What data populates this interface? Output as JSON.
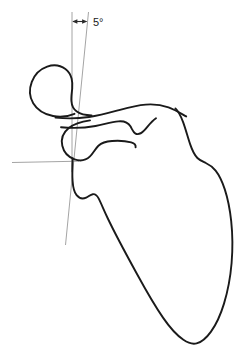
{
  "figure": {
    "kind": "anatomical-line-drawing",
    "width": 251,
    "height": 362,
    "background_color": "#ffffff"
  },
  "annotation": {
    "angle_label": "5°",
    "angle_value": 5,
    "angle_unit": "degrees",
    "arrow_style": "double-headed",
    "label_position": "top-right-of-arrow"
  },
  "colors": {
    "outline": "#1a1a1a",
    "reference_line": "#9a9a9a",
    "arrow": "#2b2b2b",
    "text": "#1a1a1a",
    "background": "#ffffff"
  },
  "reference_lines": {
    "vertical_label": "vertical reference axis",
    "tilted_label": "tilted scapular axis",
    "horizontal_label": "horizontal reference axis"
  },
  "anatomy_parts": [
    {
      "name": "coracoid-process",
      "label": "coracoid process"
    },
    {
      "name": "acromion-spine",
      "label": "acromion and scapular spine"
    },
    {
      "name": "glenoid-neck",
      "label": "glenoid and neck"
    },
    {
      "name": "scapular-body",
      "label": "scapular body"
    },
    {
      "name": "inferior-angle",
      "label": "inferior angle"
    }
  ],
  "geometry": {
    "vertical_line": {
      "x1": 72,
      "y1": 12,
      "x2": 72,
      "y2": 172
    },
    "tilted_line": {
      "x1": 88,
      "y1": 12,
      "x2": 65,
      "y2": 245
    },
    "horizontal_line": {
      "x1": 12,
      "y1": 163,
      "x2": 78,
      "y2": 161
    },
    "arrow": {
      "x1": 73,
      "y1": 21,
      "x2": 87,
      "y2": 21
    },
    "label_anchor": {
      "x": 93,
      "y": 25
    }
  }
}
